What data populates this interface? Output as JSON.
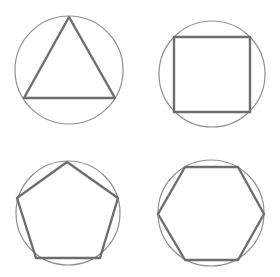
{
  "figure": {
    "colors": {
      "background": "#ffffff",
      "circle_stroke": "#8f8f8f",
      "polygon_stroke": "#6e6e6e"
    },
    "panels": [
      {
        "name": "triangle",
        "sides": 3,
        "circle": {
          "cx": 69,
          "cy": 70,
          "r": 54
        },
        "points": "69,17 115,98 24,98"
      },
      {
        "name": "square",
        "sides": 4,
        "circle": {
          "cx": 212,
          "cy": 74,
          "r": 53
        },
        "points": "174,37 250,37 250,112 174,112"
      },
      {
        "name": "pentagon",
        "sides": 5,
        "circle": {
          "cx": 68,
          "cy": 213,
          "r": 52
        },
        "points": "67,162 118,198 100,258 36,258 17,198"
      },
      {
        "name": "hexagon",
        "sides": 6,
        "circle": {
          "cx": 211,
          "cy": 213,
          "r": 53
        },
        "points": "185,167 238,167 264,214 238,260 185,260 158,214"
      }
    ]
  }
}
